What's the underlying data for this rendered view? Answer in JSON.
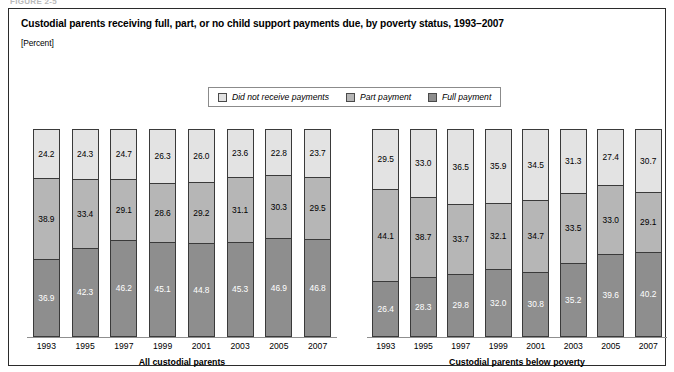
{
  "figure_tag": "FIGURE 2-5",
  "chart_data": {
    "type": "bar",
    "subtype": "stacked-bar-100",
    "title": "Custodial parents receiving full, part, or no child support payments due, by poverty status, 1993–2007",
    "units_label": "[Percent]",
    "xlabel": "",
    "ylabel": "",
    "ylim": [
      0,
      100
    ],
    "grid": false,
    "legend_position": "top-center",
    "legend": [
      {
        "name": "Did not receive payments",
        "color": "#e3e3e3"
      },
      {
        "name": "Part payment",
        "color": "#b6b6b6"
      },
      {
        "name": "Full payment",
        "color": "#8e8e8e"
      }
    ],
    "panels": [
      {
        "group_label": "All custodial parents",
        "categories": [
          "1993",
          "1995",
          "1997",
          "1999",
          "2001",
          "2003",
          "2005",
          "2007"
        ],
        "series": [
          {
            "name": "Did not receive payments",
            "values": [
              24.2,
              24.3,
              24.7,
              26.3,
              26.0,
              23.6,
              22.8,
              23.7
            ]
          },
          {
            "name": "Part payment",
            "values": [
              38.9,
              33.4,
              29.1,
              28.6,
              29.2,
              31.1,
              30.3,
              29.5
            ]
          },
          {
            "name": "Full payment",
            "values": [
              36.9,
              42.3,
              46.2,
              45.1,
              44.8,
              45.3,
              46.9,
              46.8
            ]
          }
        ]
      },
      {
        "group_label": "Custodial parents below poverty",
        "categories": [
          "1993",
          "1995",
          "1997",
          "1999",
          "2001",
          "2003",
          "2005",
          "2007"
        ],
        "series": [
          {
            "name": "Did not receive payments",
            "values": [
              29.5,
              33.0,
              36.5,
              35.9,
              34.5,
              31.3,
              27.4,
              30.7
            ]
          },
          {
            "name": "Part payment",
            "values": [
              44.1,
              38.7,
              33.7,
              32.1,
              34.7,
              33.5,
              33.0,
              29.1
            ]
          },
          {
            "name": "Full payment",
            "values": [
              26.4,
              28.3,
              29.8,
              32.0,
              30.8,
              35.2,
              39.6,
              40.2
            ]
          }
        ]
      }
    ]
  }
}
